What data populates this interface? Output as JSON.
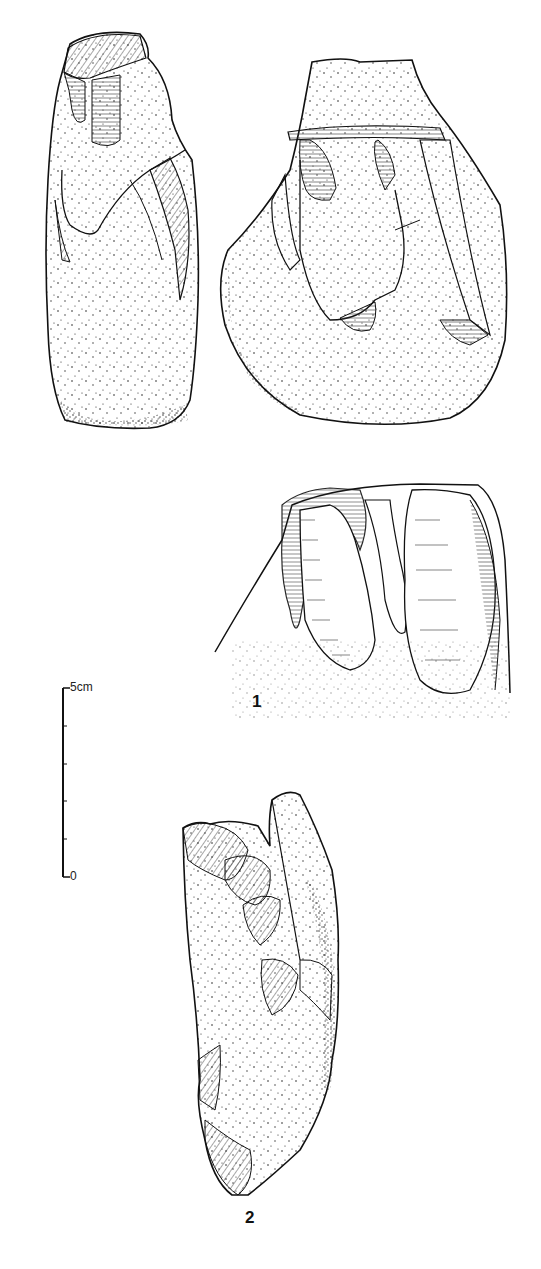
{
  "figure": {
    "type": "archaeological lithic illustration",
    "items": [
      {
        "label": "1",
        "description": "Core shown in three views: side view, front face view with flake scars, and detail of the upper flaking face"
      },
      {
        "label": "2",
        "description": "Elongated flaked stone artefact with cortex and flake removals"
      }
    ],
    "scale_bar": {
      "top_label": "5cm",
      "bottom_label": "0",
      "divisions": 5
    },
    "caption_partial": "",
    "colors": {
      "ink": "#111111",
      "background": "#ffffff"
    }
  }
}
